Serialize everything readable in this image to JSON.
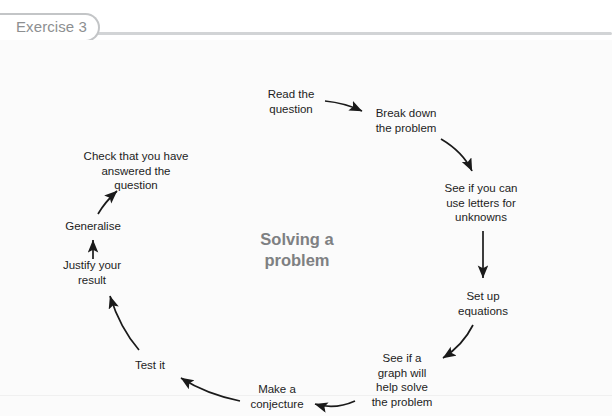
{
  "header": {
    "exercise_tab_label": "Exercise 3"
  },
  "diagram": {
    "type": "cycle",
    "center_title_lines": [
      "Solving a",
      "problem"
    ],
    "center_title": "Solving a problem",
    "node_count": 10,
    "nodes": [
      {
        "id": "read-the-question",
        "lines": [
          "Read the",
          "question"
        ],
        "x": 291,
        "y": 61
      },
      {
        "id": "break-down-problem",
        "lines": [
          "Break down",
          "the problem"
        ],
        "x": 406,
        "y": 80
      },
      {
        "id": "use-letters",
        "lines": [
          "See if you can",
          "use letters for",
          "unknowns"
        ],
        "x": 481,
        "y": 163
      },
      {
        "id": "set-up-equations",
        "lines": [
          "Set up",
          "equations"
        ],
        "x": 483,
        "y": 263
      },
      {
        "id": "graph-help-solve",
        "lines": [
          "See if a",
          "graph will",
          "help solve",
          "the problem"
        ],
        "x": 402,
        "y": 340
      },
      {
        "id": "make-a-conjecture",
        "lines": [
          "Make a",
          "conjecture"
        ],
        "x": 277,
        "y": 356
      },
      {
        "id": "test-it",
        "lines": [
          "Test it"
        ],
        "x": 150,
        "y": 325
      },
      {
        "id": "justify-your-result",
        "lines": [
          "Justify your",
          "result"
        ],
        "x": 92,
        "y": 232
      },
      {
        "id": "generalise",
        "lines": [
          "Generalise"
        ],
        "x": 93,
        "y": 186
      },
      {
        "id": "check-answered",
        "lines": [
          "Check that you have",
          "answered the",
          "question"
        ],
        "x": 136,
        "y": 131
      }
    ],
    "arrows": [
      {
        "from": "read-the-question",
        "to": "break-down-problem",
        "style": "curved"
      },
      {
        "from": "break-down-problem",
        "to": "use-letters",
        "style": "curved"
      },
      {
        "from": "use-letters",
        "to": "set-up-equations",
        "style": "straight"
      },
      {
        "from": "set-up-equations",
        "to": "graph-help-solve",
        "style": "curved"
      },
      {
        "from": "graph-help-solve",
        "to": "make-a-conjecture",
        "style": "curved"
      },
      {
        "from": "make-a-conjecture",
        "to": "test-it",
        "style": "curved"
      },
      {
        "from": "test-it",
        "to": "justify-your-result",
        "style": "curved"
      },
      {
        "from": "justify-your-result",
        "to": "generalise",
        "style": "straight"
      },
      {
        "from": "generalise",
        "to": "check-answered",
        "style": "curved"
      }
    ]
  },
  "colors": {
    "page_background": "#ffffff",
    "panel_background": "#fbfbfb",
    "tab_border": "#c3c5c7",
    "tab_text": "#8d8f91",
    "rule": "#d2d4d6",
    "node_text": "#1d1d1d",
    "center_title": "#7e8082",
    "arrow": "#1a1a1a"
  }
}
